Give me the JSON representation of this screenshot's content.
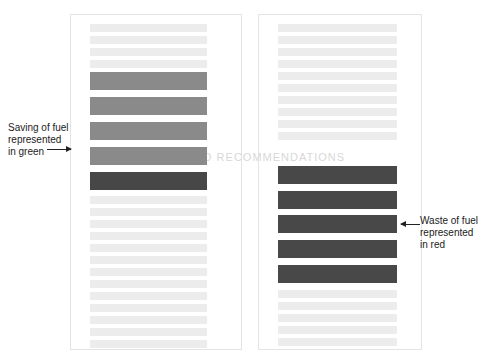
{
  "left_page": {
    "label": [
      "Saving of fuel",
      "represented",
      "in green"
    ],
    "bar_colors": [
      "#8a8a8a",
      "#8a8a8a",
      "#8a8a8a",
      "#8a8a8a",
      "#474747"
    ],
    "bar_tops": [
      72,
      97,
      122,
      147,
      172
    ]
  },
  "right_page": {
    "label": [
      "Waste of fuel",
      "represented",
      "in red"
    ],
    "bar_colors": [
      "#484848",
      "#484848",
      "#484848",
      "#484848",
      "#484848"
    ],
    "bar_tops": [
      166,
      191,
      215,
      240,
      265
    ]
  },
  "faint_heading": "IONS AND RECOMMENDATIONS",
  "colors": {
    "saving_bar": "#8a8a8a",
    "dark_bar": "#474747",
    "page_border": "#e4e4e4",
    "text_line": "#ececec"
  }
}
